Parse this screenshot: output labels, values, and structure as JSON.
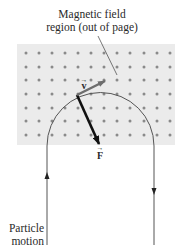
{
  "figure": {
    "title_lines": [
      "Magnetic field",
      "region (out of page)"
    ],
    "particle_label_lines": [
      "Particle",
      "motion"
    ],
    "velocity_label": "v",
    "force_label": "F",
    "vector_arrow_glyph": "→"
  },
  "colors": {
    "background": "#ffffff",
    "field_region": "#ebebeb",
    "field_dot": "#8a8a8a",
    "path_line": "#555555",
    "velocity_vector": "#6e6e6e",
    "force_vector": "#111111",
    "text": "#2a2a2a"
  },
  "field_region": {
    "x": 17,
    "y": 44,
    "width": 158,
    "height": 101,
    "dot_columns": [
      26,
      39,
      52,
      65,
      78,
      91,
      104,
      117,
      130,
      144,
      157,
      170
    ],
    "dot_rows": [
      53,
      67,
      80,
      94,
      108,
      121,
      135
    ],
    "dot_meaning": "field out of page"
  },
  "path": {
    "arc_center": [
      100.5,
      146
    ],
    "arc_radius": 53.5,
    "left_leg_x": 47,
    "right_leg_x": 154,
    "bottom_y": 245,
    "up_arrow_y": 176,
    "down_arrow_y": 191
  },
  "particle_point": [
    77,
    95
  ],
  "velocity_vector": {
    "from": [
      77,
      95
    ],
    "to": [
      105,
      81
    ]
  },
  "force_vector": {
    "from": [
      77,
      95
    ],
    "to": [
      99,
      144
    ]
  },
  "leader_line": {
    "from": [
      98,
      36
    ],
    "to": [
      117,
      75
    ]
  }
}
